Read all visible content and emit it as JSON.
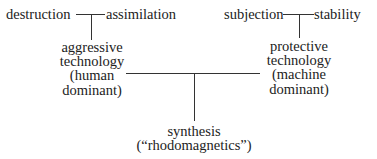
{
  "diagram": {
    "top_left": {
      "left_term": "destruction",
      "right_term": "assimilation"
    },
    "top_right": {
      "left_term": "subjection",
      "right_term": "stability"
    },
    "left_node": {
      "lines": [
        "aggressive",
        "technology",
        "(human",
        "dominant)"
      ]
    },
    "right_node": {
      "lines": [
        "protective",
        "technology",
        "(machine",
        "dominant)"
      ]
    },
    "bottom_node": {
      "lines": [
        "synthesis",
        "(“rhodomagnetics”)"
      ]
    },
    "colors": {
      "text": "#222222",
      "line": "#333333",
      "background": "#ffffff"
    }
  }
}
